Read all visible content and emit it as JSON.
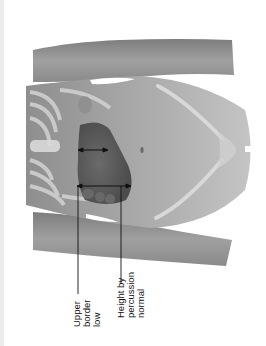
{
  "figure": {
    "labels": [
      {
        "id": "upper-border",
        "lines": [
          "Upper",
          "border",
          "low"
        ]
      },
      {
        "id": "height-by-percussion",
        "lines": [
          "Height by",
          "percussion",
          "normal"
        ]
      }
    ],
    "colors": {
      "skin": "#9a9a9a",
      "skin_light": "#b9b9b9",
      "liver": "#5e5e5e",
      "bone": "#cfcfcf",
      "line": "#111111"
    }
  }
}
